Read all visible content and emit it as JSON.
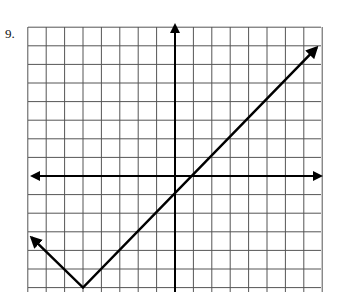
{
  "problem": {
    "number_label": "9."
  },
  "graph": {
    "x_range": [
      -8,
      8
    ],
    "y_range": [
      -6,
      8
    ],
    "origin_px": [
      175,
      176
    ],
    "unit_px": [
      18.4,
      18.6
    ],
    "grid_left_px": 28,
    "grid_top_px": 27,
    "grid_right_px": 321,
    "colors": {
      "grid": "#555555",
      "axes": "#000000",
      "curve": "#000000"
    },
    "function": {
      "description": "absolute value V-shape",
      "vertex": [
        -5,
        -6
      ],
      "left_branch": {
        "slope": -1,
        "end_point": [
          -7.8,
          -3.3
        ]
      },
      "right_branch": {
        "slope": 1,
        "end_point": [
          7.7,
          6.9
        ]
      }
    }
  }
}
